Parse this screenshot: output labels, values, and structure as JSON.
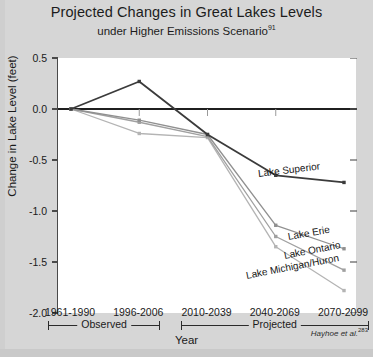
{
  "header": {
    "title": "Projected Changes in Great Lakes Levels",
    "subtitle": "under Higher Emissions Scenario",
    "subtitle_superscript": "91"
  },
  "citation": {
    "text": "Hayhoe et al.",
    "superscript": "283"
  },
  "axes": {
    "ylabel": "Change in Lake Level (feet)",
    "xlabel": "Year",
    "yticks": [
      "0.5",
      "0.0",
      "-0.5",
      "-1.0",
      "-1.5",
      "-2.0"
    ],
    "xticks": [
      "1961-1990",
      "1996-2006",
      "2010-2039",
      "2040-2069",
      "2070-2099"
    ]
  },
  "periods": [
    {
      "label": "Observed"
    },
    {
      "label": "Projected"
    }
  ],
  "series_labels": [
    {
      "name": "Lake Superior"
    },
    {
      "name": "Lake Erie"
    },
    {
      "name": "Lake Ontario"
    },
    {
      "name": "Lake Michigan/Huron"
    }
  ],
  "chart_data": {
    "type": "line",
    "title": "Projected Changes in Great Lakes Levels under Higher Emissions Scenario",
    "xlabel": "Year",
    "ylabel": "Change in Lake Level (feet)",
    "categories": [
      "1961-1990",
      "1996-2006",
      "2010-2039",
      "2040-2069",
      "2070-2099"
    ],
    "ylim": [
      -2.0,
      0.5
    ],
    "ytick_values": [
      0.5,
      0.0,
      -0.5,
      -1.0,
      -1.5,
      -2.0
    ],
    "grid": false,
    "legend": "inline-right-labels",
    "zero_line": true,
    "series": [
      {
        "name": "Lake Superior",
        "color": "#3b3b3b",
        "values": [
          0.0,
          0.27,
          -0.25,
          -0.65,
          -0.72
        ]
      },
      {
        "name": "Lake Erie",
        "color": "#909090",
        "values": [
          0.0,
          -0.11,
          -0.25,
          -1.14,
          -1.37
        ]
      },
      {
        "name": "Lake Ontario",
        "color": "#a0a0a0",
        "values": [
          0.0,
          -0.13,
          -0.27,
          -1.25,
          -1.58
        ]
      },
      {
        "name": "Lake Michigan/Huron",
        "color": "#b4b4b4",
        "values": [
          0.0,
          -0.24,
          -0.28,
          -1.35,
          -1.78
        ]
      }
    ],
    "annotations": [
      {
        "text": "Observed",
        "span": [
          "1961-1990",
          "1996-2006"
        ]
      },
      {
        "text": "Projected",
        "span": [
          "2010-2039",
          "2070-2099"
        ]
      }
    ]
  }
}
